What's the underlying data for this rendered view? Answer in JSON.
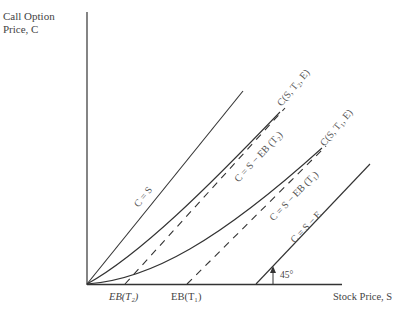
{
  "axes": {
    "y_label_line1": "Call Option",
    "y_label_line2": "Price, C",
    "x_label": "Stock Price, S"
  },
  "x_ticks": {
    "t2": "EB(T₂)",
    "t1": "EB(T₁)"
  },
  "curves": {
    "c_eq_s": "C = S",
    "c_t2": "C(S, T₂, E)",
    "c_t1": "C(S, T₁, E)",
    "lower_t2": "C = S − EB (T₂)",
    "lower_t1": "C = S − EB (T₁)",
    "intrinsic": "C = S − E"
  },
  "angle_label": "45°",
  "colors": {
    "line": "#333333",
    "text": "#444444"
  }
}
